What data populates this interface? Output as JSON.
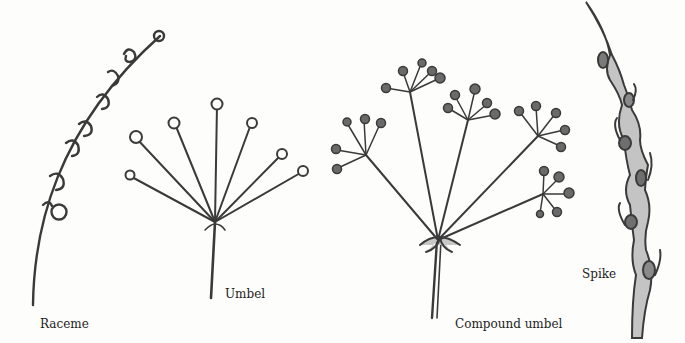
{
  "diagram": {
    "type": "botanical-inflorescence-types",
    "items": [
      {
        "id": "raceme",
        "label": "Raceme"
      },
      {
        "id": "umbel",
        "label": "Umbel"
      },
      {
        "id": "compound-umbel",
        "label": "Compound umbel"
      },
      {
        "id": "spike",
        "label": "Spike"
      }
    ],
    "colors": {
      "ink": "#3a3a3a",
      "fill_dark": "#6a6a6a",
      "fill_light": "#bdbdbd",
      "background": "#fdfdfb"
    }
  }
}
